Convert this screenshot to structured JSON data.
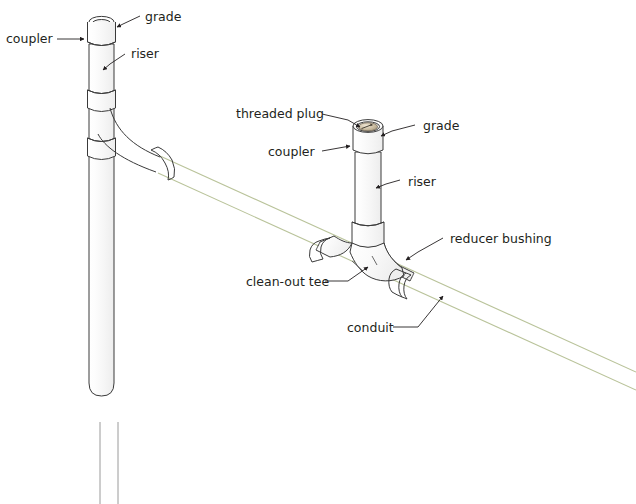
{
  "diagram": {
    "type": "technical-line-drawing",
    "background_color": "#ffffff",
    "line_color": "#3a3a3a",
    "conduit_color": "#b9c39a",
    "text_color": "#231f20",
    "plug_color": "#b9a98c"
  },
  "labels": {
    "grade_left": "grade",
    "coupler_left": "coupler",
    "riser_left": "riser",
    "threaded_plug": "threaded plug",
    "grade_right": "grade",
    "coupler_right": "coupler",
    "riser_right": "riser",
    "reducer_bushing": "reducer bushing",
    "clean_out_tee": "clean-out tee",
    "conduit": "conduit"
  },
  "components": [
    {
      "name": "left-riser-pipe",
      "label": "riser"
    },
    {
      "name": "left-upper-coupler",
      "label": "coupler"
    },
    {
      "name": "left-grade-opening",
      "label": "grade"
    },
    {
      "name": "left-sweep-elbow",
      "label": ""
    },
    {
      "name": "left-conduit-coupler",
      "label": ""
    },
    {
      "name": "right-riser-pipe",
      "label": "riser"
    },
    {
      "name": "right-coupler",
      "label": "coupler"
    },
    {
      "name": "right-threaded-plug",
      "label": "threaded plug"
    },
    {
      "name": "right-grade-opening",
      "label": "grade"
    },
    {
      "name": "clean-out-tee",
      "label": "clean-out tee"
    },
    {
      "name": "reducer-bushing",
      "label": "reducer bushing"
    },
    {
      "name": "conduit-run",
      "label": "conduit"
    }
  ]
}
